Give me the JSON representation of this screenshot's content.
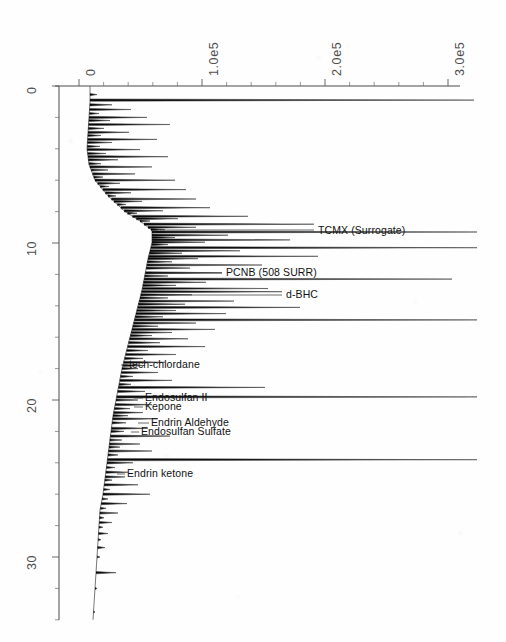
{
  "chart_data": {
    "type": "line",
    "title": "",
    "subtitle": "",
    "orientation": "rotated-90",
    "xlabel": "",
    "ylabel": "",
    "xlim": [
      0,
      345000
    ],
    "ylim": [
      0,
      35
    ],
    "grid": false,
    "legend": null,
    "x_axis": {
      "position": "top",
      "unit": "abundance",
      "tick_labels": [
        "0",
        "1.0e5",
        "2.0e5",
        "3.0e5"
      ],
      "tick_values": [
        0,
        100000,
        200000,
        300000
      ],
      "tick_pixels": [
        79,
        202,
        325,
        448
      ],
      "minor_ticks_per_interval": 4
    },
    "y_axis": {
      "position": "left",
      "unit": "minutes",
      "tick_labels": [
        "0",
        "10",
        "20",
        "30"
      ],
      "tick_values": [
        0,
        10,
        20,
        30
      ],
      "tick_pixels": [
        86,
        243,
        400,
        557
      ],
      "minor_ticks_per_interval": 4
    },
    "annotations": [
      {
        "label": "TCMX (Surrogate)",
        "retention_time": 8.8,
        "intensity": 195000,
        "label_x": 318,
        "label_y": 224,
        "leader_from_x": 160,
        "leader_to_x": 314,
        "leader_y": 230
      },
      {
        "label": "PCNB (508 SURR)",
        "retention_time": 11.9,
        "intensity": 120000,
        "label_x": 226,
        "label_y": 266,
        "leader_from_x": 152,
        "leader_to_x": 222,
        "leader_y": 273
      },
      {
        "label": "d-BHC",
        "retention_time": 13.1,
        "intensity": 118000,
        "label_x": 286,
        "label_y": 288,
        "leader_from_x": 160,
        "leader_to_x": 282,
        "leader_y": 295
      },
      {
        "label": "tech-chlordane",
        "retention_time": 17.8,
        "intensity": 24000,
        "label_x": 129,
        "label_y": 358,
        "leader_from_x": 121,
        "leader_to_x": 128,
        "leader_y": 365
      },
      {
        "label": "Endosulfan II",
        "retention_time": 19.8,
        "intensity": 30000,
        "label_x": 145,
        "label_y": 391,
        "leader_from_x": 134,
        "leader_to_x": 143,
        "leader_y": 398
      },
      {
        "label": "Kepone",
        "retention_time": 20.3,
        "intensity": 25000,
        "label_x": 145,
        "label_y": 400,
        "leader_from_x": 134,
        "leader_to_x": 143,
        "leader_y": 407
      },
      {
        "label": "Endrin Aldehyde",
        "retention_time": 21.2,
        "intensity": 32000,
        "label_x": 151,
        "label_y": 416,
        "leader_from_x": 138,
        "leader_to_x": 149,
        "leader_y": 423
      },
      {
        "label": "Endosulfan Sulfate",
        "retention_time": 21.8,
        "intensity": 28000,
        "label_x": 141,
        "label_y": 425,
        "leader_from_x": 131,
        "leader_to_x": 139,
        "leader_y": 432
      },
      {
        "label": "Endrin ketone",
        "retention_time": 24.9,
        "intensity": 22000,
        "label_x": 127,
        "label_y": 467,
        "leader_from_x": 117,
        "leader_to_x": 125,
        "leader_y": 474
      }
    ],
    "baseline_drift": [
      {
        "t": 0.0,
        "x": 90
      },
      {
        "t": 1.0,
        "x": 90
      },
      {
        "t": 2.0,
        "x": 89
      },
      {
        "t": 3.0,
        "x": 88
      },
      {
        "t": 4.0,
        "x": 87
      },
      {
        "t": 5.0,
        "x": 89
      },
      {
        "t": 6.0,
        "x": 95
      },
      {
        "t": 7.0,
        "x": 108
      },
      {
        "t": 8.0,
        "x": 125
      },
      {
        "t": 8.6,
        "x": 140
      },
      {
        "t": 9.2,
        "x": 152
      },
      {
        "t": 10.0,
        "x": 152
      },
      {
        "t": 11.0,
        "x": 148
      },
      {
        "t": 12.0,
        "x": 145
      },
      {
        "t": 13.0,
        "x": 142
      },
      {
        "t": 14.0,
        "x": 138
      },
      {
        "t": 15.0,
        "x": 134
      },
      {
        "t": 16.0,
        "x": 130
      },
      {
        "t": 17.0,
        "x": 126
      },
      {
        "t": 18.0,
        "x": 122
      },
      {
        "t": 19.0,
        "x": 119
      },
      {
        "t": 20.0,
        "x": 116
      },
      {
        "t": 21.0,
        "x": 113
      },
      {
        "t": 22.0,
        "x": 111
      },
      {
        "t": 23.0,
        "x": 109
      },
      {
        "t": 24.0,
        "x": 107
      },
      {
        "t": 25.0,
        "x": 105
      },
      {
        "t": 26.0,
        "x": 103
      },
      {
        "t": 27.0,
        "x": 100
      },
      {
        "t": 28.0,
        "x": 99
      },
      {
        "t": 29.0,
        "x": 98
      },
      {
        "t": 30.0,
        "x": 97
      },
      {
        "t": 31.0,
        "x": 96
      },
      {
        "t": 32.0,
        "x": 95
      },
      {
        "t": 33.0,
        "x": 94
      },
      {
        "t": 34.0,
        "x": 93
      }
    ],
    "peaks": [
      {
        "t": 0.55,
        "x": 97
      },
      {
        "t": 0.9,
        "x": 474
      },
      {
        "t": 1.2,
        "x": 112
      },
      {
        "t": 1.5,
        "x": 131
      },
      {
        "t": 1.75,
        "x": 99
      },
      {
        "t": 2.0,
        "x": 147
      },
      {
        "t": 2.2,
        "x": 110
      },
      {
        "t": 2.45,
        "x": 170
      },
      {
        "t": 2.7,
        "x": 104
      },
      {
        "t": 2.95,
        "x": 129
      },
      {
        "t": 3.15,
        "x": 101
      },
      {
        "t": 3.4,
        "x": 157
      },
      {
        "t": 3.6,
        "x": 112
      },
      {
        "t": 3.85,
        "x": 100
      },
      {
        "t": 4.05,
        "x": 140
      },
      {
        "t": 4.3,
        "x": 106
      },
      {
        "t": 4.5,
        "x": 168
      },
      {
        "t": 4.7,
        "x": 118
      },
      {
        "t": 4.95,
        "x": 101
      },
      {
        "t": 5.15,
        "x": 152
      },
      {
        "t": 5.35,
        "x": 108
      },
      {
        "t": 5.6,
        "x": 135
      },
      {
        "t": 5.8,
        "x": 103
      },
      {
        "t": 6.0,
        "x": 175
      },
      {
        "t": 6.2,
        "x": 120
      },
      {
        "t": 6.4,
        "x": 109
      },
      {
        "t": 6.6,
        "x": 186
      },
      {
        "t": 6.8,
        "x": 131
      },
      {
        "t": 7.0,
        "x": 116
      },
      {
        "t": 7.2,
        "x": 196
      },
      {
        "t": 7.35,
        "x": 142
      },
      {
        "t": 7.55,
        "x": 126
      },
      {
        "t": 7.75,
        "x": 210
      },
      {
        "t": 7.95,
        "x": 163
      },
      {
        "t": 8.1,
        "x": 137
      },
      {
        "t": 8.3,
        "x": 248
      },
      {
        "t": 8.45,
        "x": 178
      },
      {
        "t": 8.6,
        "x": 150
      },
      {
        "t": 8.8,
        "x": 314
      },
      {
        "t": 9.0,
        "x": 196
      },
      {
        "t": 9.15,
        "x": 165
      },
      {
        "t": 9.3,
        "x": 477
      },
      {
        "t": 9.5,
        "x": 228
      },
      {
        "t": 9.65,
        "x": 175
      },
      {
        "t": 9.8,
        "x": 290
      },
      {
        "t": 9.95,
        "x": 205
      },
      {
        "t": 10.1,
        "x": 168
      },
      {
        "t": 10.3,
        "x": 477
      },
      {
        "t": 10.5,
        "x": 240
      },
      {
        "t": 10.65,
        "x": 182
      },
      {
        "t": 10.85,
        "x": 318
      },
      {
        "t": 11.0,
        "x": 198
      },
      {
        "t": 11.2,
        "x": 172
      },
      {
        "t": 11.4,
        "x": 262
      },
      {
        "t": 11.6,
        "x": 190
      },
      {
        "t": 11.9,
        "x": 222
      },
      {
        "t": 12.1,
        "x": 168
      },
      {
        "t": 12.3,
        "x": 452
      },
      {
        "t": 12.5,
        "x": 206
      },
      {
        "t": 12.7,
        "x": 176
      },
      {
        "t": 12.9,
        "x": 268
      },
      {
        "t": 13.1,
        "x": 282
      },
      {
        "t": 13.3,
        "x": 192
      },
      {
        "t": 13.5,
        "x": 168
      },
      {
        "t": 13.7,
        "x": 234
      },
      {
        "t": 13.9,
        "x": 185
      },
      {
        "t": 14.1,
        "x": 300
      },
      {
        "t": 14.3,
        "x": 176
      },
      {
        "t": 14.5,
        "x": 226
      },
      {
        "t": 14.7,
        "x": 163
      },
      {
        "t": 14.9,
        "x": 477
      },
      {
        "t": 15.1,
        "x": 196
      },
      {
        "t": 15.3,
        "x": 158
      },
      {
        "t": 15.5,
        "x": 215
      },
      {
        "t": 15.7,
        "x": 172
      },
      {
        "t": 15.9,
        "x": 152
      },
      {
        "t": 16.1,
        "x": 188
      },
      {
        "t": 16.35,
        "x": 160
      },
      {
        "t": 16.6,
        "x": 205
      },
      {
        "t": 16.85,
        "x": 148
      },
      {
        "t": 17.1,
        "x": 176
      },
      {
        "t": 17.35,
        "x": 143
      },
      {
        "t": 17.6,
        "x": 165
      },
      {
        "t": 17.8,
        "x": 145
      },
      {
        "t": 18.0,
        "x": 138
      },
      {
        "t": 18.25,
        "x": 158
      },
      {
        "t": 18.5,
        "x": 133
      },
      {
        "t": 18.75,
        "x": 172
      },
      {
        "t": 19.0,
        "x": 131
      },
      {
        "t": 19.2,
        "x": 265
      },
      {
        "t": 19.45,
        "x": 145
      },
      {
        "t": 19.8,
        "x": 477
      },
      {
        "t": 20.0,
        "x": 138
      },
      {
        "t": 20.3,
        "x": 152
      },
      {
        "t": 20.55,
        "x": 130
      },
      {
        "t": 20.8,
        "x": 143
      },
      {
        "t": 21.0,
        "x": 128
      },
      {
        "t": 21.2,
        "x": 158
      },
      {
        "t": 21.45,
        "x": 126
      },
      {
        "t": 21.8,
        "x": 148
      },
      {
        "t": 22.0,
        "x": 124
      },
      {
        "t": 22.3,
        "x": 170
      },
      {
        "t": 22.55,
        "x": 122
      },
      {
        "t": 22.8,
        "x": 140
      },
      {
        "t": 23.0,
        "x": 120
      },
      {
        "t": 23.25,
        "x": 152
      },
      {
        "t": 23.5,
        "x": 118
      },
      {
        "t": 23.8,
        "x": 477
      },
      {
        "t": 24.0,
        "x": 133
      },
      {
        "t": 24.3,
        "x": 115
      },
      {
        "t": 24.6,
        "x": 128
      },
      {
        "t": 24.9,
        "x": 125
      },
      {
        "t": 25.1,
        "x": 112
      },
      {
        "t": 25.4,
        "x": 138
      },
      {
        "t": 25.7,
        "x": 110
      },
      {
        "t": 26.0,
        "x": 150
      },
      {
        "t": 26.3,
        "x": 108
      },
      {
        "t": 26.6,
        "x": 127
      },
      {
        "t": 26.9,
        "x": 106
      },
      {
        "t": 27.2,
        "x": 118
      },
      {
        "t": 27.5,
        "x": 104
      },
      {
        "t": 27.8,
        "x": 112
      },
      {
        "t": 28.1,
        "x": 103
      },
      {
        "t": 28.5,
        "x": 108
      },
      {
        "t": 28.9,
        "x": 101
      },
      {
        "t": 29.4,
        "x": 105
      },
      {
        "t": 30.0,
        "x": 100
      },
      {
        "t": 31.0,
        "x": 116
      },
      {
        "t": 32.0,
        "x": 97
      },
      {
        "t": 33.5,
        "x": 95
      }
    ]
  },
  "plot_geometry": {
    "axis_origin_x": 59,
    "axis_origin_y": 86,
    "axis_x_end": 460,
    "axis_y_end": 620,
    "note": ""
  }
}
